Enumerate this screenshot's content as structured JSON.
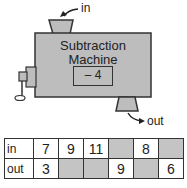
{
  "machine": {
    "title_line1": "Subtraction",
    "title_line2": "Machine",
    "rule": "– 4",
    "in_label": "in",
    "out_label": "out",
    "color": "#bdbdbd"
  },
  "table": {
    "rows": [
      {
        "label": "in",
        "cells": [
          "7",
          "9",
          "11",
          "",
          "8",
          ""
        ],
        "shaded": [
          false,
          false,
          false,
          true,
          false,
          true
        ]
      },
      {
        "label": "out",
        "cells": [
          "3",
          "",
          "",
          "9",
          "",
          "6"
        ],
        "shaded": [
          false,
          true,
          true,
          false,
          true,
          false
        ]
      }
    ]
  }
}
